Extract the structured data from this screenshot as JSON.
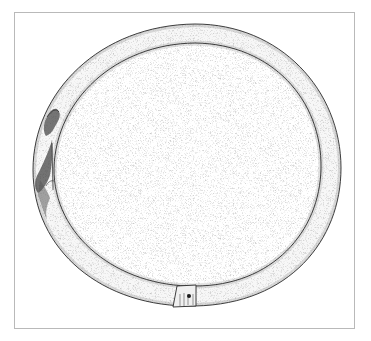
{
  "figure": {
    "style": "stippled line drawing",
    "caption": ""
  },
  "colors": {
    "background": "#ffffff",
    "frame": "#b9b9b9",
    "outline": "#2a2a2a",
    "stipple": "#8a8a8a",
    "damage": "#3a3a3a"
  },
  "ring": {
    "outer": {
      "cx": 186,
      "cy": 164,
      "rx": 154,
      "ry": 140
    },
    "inner": {
      "cx": 188,
      "cy": 164,
      "rx": 134,
      "ry": 120
    }
  }
}
